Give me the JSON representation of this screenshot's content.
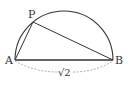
{
  "diagram": {
    "type": "geometry",
    "points": {
      "A": {
        "label": "A",
        "x": 15,
        "y": 60
      },
      "B": {
        "label": "B",
        "x": 113,
        "y": 60
      },
      "P": {
        "label": "P",
        "x": 33,
        "y": 22
      }
    },
    "segments": [
      {
        "from": "A",
        "to": "B",
        "style": "solid"
      },
      {
        "from": "A",
        "to": "P",
        "style": "solid"
      },
      {
        "from": "P",
        "to": "B",
        "style": "solid"
      }
    ],
    "arc": {
      "from": "A",
      "to": "B",
      "style": "solid",
      "shape": "semicircle"
    },
    "dimension": {
      "from": "A",
      "to": "B",
      "style": "dashed",
      "label": "√2"
    },
    "colors": {
      "line": "#333333",
      "dashed": "#999999",
      "background": "#ffffff"
    }
  }
}
